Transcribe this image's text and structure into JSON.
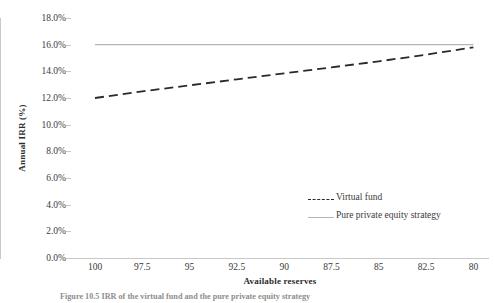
{
  "chart_data": {
    "type": "line",
    "title": "",
    "xlabel": "Available reserves",
    "ylabel": "Annual IRR (%)",
    "x": [
      100,
      97.5,
      95,
      92.5,
      90,
      87.5,
      85,
      82.5,
      80
    ],
    "xticklabels": [
      "100",
      "97.5",
      "95",
      "92.5",
      "90",
      "87.5",
      "85",
      "82.5",
      "80"
    ],
    "xlim": [
      100,
      80
    ],
    "x_axis_reversed": true,
    "ylim": [
      0,
      18
    ],
    "yticks": [
      18,
      16,
      14,
      12,
      10,
      8,
      6,
      4,
      2,
      0
    ],
    "yticklabels": [
      "18.0%",
      "16.0%",
      "14.0%",
      "12.0%",
      "10.0%",
      "8.0%",
      "6.0%",
      "4.0%",
      "2.0%",
      "0.0%"
    ],
    "grid": false,
    "legend_position": "center-right",
    "series": [
      {
        "name": "Virtual fund",
        "style": "dashed",
        "color": "#2a2a2a",
        "values": [
          12.0,
          12.5,
          12.95,
          13.4,
          13.85,
          14.3,
          14.75,
          15.25,
          15.8
        ]
      },
      {
        "name": "Pure private equity strategy",
        "style": "solid",
        "color": "#b5b5b5",
        "values": [
          16.0,
          16.0,
          16.0,
          16.0,
          16.0,
          16.0,
          16.0,
          16.0,
          16.0
        ]
      }
    ]
  },
  "legend": {
    "entries": [
      {
        "label": "Virtual fund",
        "swatch": "dashed-line-swatch"
      },
      {
        "label": "Pure private equity strategy",
        "swatch": "solid-line-swatch"
      }
    ]
  },
  "caption": {
    "text": "Figure 10.5   IRR of the virtual fund and the pure private equity strategy"
  }
}
